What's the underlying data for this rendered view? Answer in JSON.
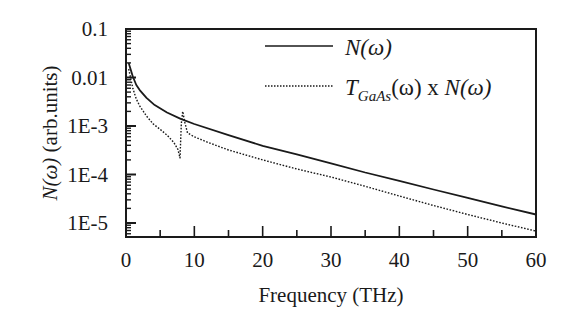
{
  "chart_data": {
    "type": "line",
    "title": "",
    "xlabel": "Frequency (THz)",
    "ylabel_parts": {
      "italic": "N(ω)",
      "rest": " (arb.units)"
    },
    "ylabel": "N(ω) (arb.units)",
    "xlim": [
      0,
      60
    ],
    "ylim": [
      3.5e-06,
      0.1
    ],
    "yscale": "log",
    "grid": false,
    "legend_position": "upper right",
    "x_ticks": [
      0,
      10,
      20,
      30,
      40,
      50,
      60
    ],
    "x_tick_labels": [
      "0",
      "10",
      "20",
      "30",
      "40",
      "50",
      "60"
    ],
    "y_ticks": [
      0.1,
      0.01,
      0.001,
      0.0001,
      1e-05
    ],
    "y_tick_labels": [
      "0.1",
      "0.01",
      "1E-3",
      "1E-4",
      "1E-5"
    ],
    "series": [
      {
        "name": "N(ω)",
        "legend": {
          "italic": "N(ω)"
        },
        "style": "solid",
        "color": "#1a1a1a",
        "x": [
          0.4,
          1,
          1.5,
          2,
          3,
          4.2,
          6,
          8,
          10,
          15,
          20,
          25,
          30,
          35,
          40,
          45,
          50,
          55,
          60
        ],
        "values": [
          0.02,
          0.0105,
          0.007,
          0.0055,
          0.0038,
          0.0027,
          0.0019,
          0.0014,
          0.0011,
          0.00065,
          0.00039,
          0.00026,
          0.00017,
          0.00011,
          7.4e-05,
          4.9e-05,
          3.3e-05,
          2.2e-05,
          1.5e-05
        ]
      },
      {
        "name": "T_GaAs(ω) x N(ω)",
        "legend": {
          "T": "T",
          "sub": "GaAs",
          "rest": "(ω) x ",
          "italic2": "N(ω)"
        },
        "style": "dotted",
        "color": "#1a1a1a",
        "x": [
          0.4,
          1,
          1.5,
          2,
          3,
          4,
          5,
          6,
          7,
          7.6,
          7.9,
          8.1,
          8.3,
          8.6,
          9,
          10,
          12,
          15,
          20,
          25,
          30,
          35,
          40,
          45,
          50,
          55,
          60
        ],
        "values": [
          0.015,
          0.006,
          0.0036,
          0.0026,
          0.0016,
          0.0011,
          0.00085,
          0.00065,
          0.00046,
          0.00033,
          0.00022,
          0.0011,
          0.002,
          0.0012,
          0.00072,
          0.0006,
          0.00046,
          0.00032,
          0.0002,
          0.00013,
          8.9e-05,
          5.7e-05,
          3.6e-05,
          2.3e-05,
          1.5e-05,
          1e-05,
          6.8e-06
        ]
      }
    ]
  }
}
